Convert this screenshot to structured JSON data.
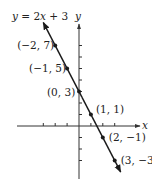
{
  "chart_data": {
    "type": "line",
    "title": "y = 2x + 3",
    "equation": "y = -2x + 3",
    "xlabel": "x",
    "ylabel": "y",
    "series": [
      {
        "name": "y = 2x + 3",
        "x": [
          -2,
          -1,
          0,
          1,
          2,
          3
        ],
        "y": [
          7,
          5,
          3,
          1,
          -1,
          -3
        ]
      }
    ],
    "points": [
      {
        "x": -2,
        "y": 7,
        "label": "(−2, 7)"
      },
      {
        "x": -1,
        "y": 5,
        "label": "(−1, 5)"
      },
      {
        "x": 0,
        "y": 3,
        "label": "(0, 3)"
      },
      {
        "x": 1,
        "y": 1,
        "label": "(1, 1)"
      },
      {
        "x": 2,
        "y": -1,
        "label": "(2, −1)"
      },
      {
        "x": 3,
        "y": -3,
        "label": "(3, −3)"
      }
    ],
    "xlim": [
      -5.3,
      5.2
    ],
    "ylim": [
      -4.5,
      8.6
    ],
    "x_ticks": [
      -3,
      -2,
      -1,
      1,
      2,
      3
    ],
    "y_ticks": [
      -3,
      -2,
      -1,
      1,
      2,
      3,
      4,
      5,
      6,
      7
    ],
    "grid": false,
    "legend": "none",
    "colors": {
      "line": "#1a1a1a",
      "axis": "#333333",
      "text": "#222222"
    }
  }
}
